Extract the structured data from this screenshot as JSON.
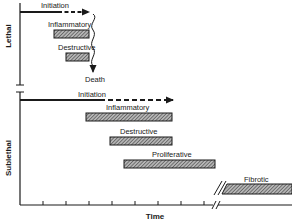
{
  "diagram": {
    "type": "timeline",
    "x_axis_label": "Time",
    "sections": [
      {
        "name": "Lethal",
        "label": "Lethal",
        "initiation_label": "Initiation",
        "phases": [
          {
            "label": "Inflammatory"
          },
          {
            "label": "Destructive"
          }
        ],
        "outcome_label": "Death"
      },
      {
        "name": "Sublethal",
        "label": "Sublethal",
        "initiation_label": "Initiation",
        "phases": [
          {
            "label": "Inflammatory"
          },
          {
            "label": "Destructive"
          },
          {
            "label": "Proliferative"
          },
          {
            "label": "Fibrotic"
          }
        ]
      }
    ]
  },
  "colors": {
    "line": "#1a1a1a",
    "bar_fill": "#8c8c8c"
  }
}
